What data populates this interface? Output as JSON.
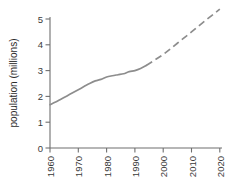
{
  "chart_data": {
    "type": "line",
    "title": "",
    "xlabel": "",
    "ylabel": "population (millions)",
    "xlim": [
      1960,
      2021
    ],
    "ylim": [
      0,
      5.3
    ],
    "grid": false,
    "legend": "none",
    "x_ticks": [
      "1960",
      "1970",
      "1980",
      "1990",
      "2000",
      "2010",
      "2020"
    ],
    "x_tick_values": [
      1960,
      1970,
      1980,
      1990,
      2000,
      2010,
      2020
    ],
    "y_ticks": [
      "0",
      "1",
      "2",
      "3",
      "4",
      "5"
    ],
    "y_tick_values": [
      0,
      1,
      2,
      3,
      4,
      5
    ],
    "series": [
      {
        "name": "population (observed)",
        "style": "solid",
        "color": "#8d8d8d",
        "x": [
          1960,
          1962,
          1964,
          1966,
          1968,
          1970,
          1972,
          1974,
          1976,
          1978,
          1980,
          1982,
          1984,
          1986,
          1988,
          1990,
          1992,
          1994
        ],
        "values": [
          1.68,
          1.78,
          1.9,
          2.02,
          2.14,
          2.26,
          2.38,
          2.5,
          2.6,
          2.66,
          2.75,
          2.8,
          2.84,
          2.88,
          2.96,
          3.0,
          3.08,
          3.2
        ]
      },
      {
        "name": "population (projected)",
        "style": "dashed",
        "color": "#8d8d8d",
        "x": [
          1994,
          2000,
          2005,
          2010,
          2015,
          2020
        ],
        "values": [
          3.2,
          3.62,
          4.06,
          4.5,
          4.95,
          5.38
        ]
      }
    ],
    "annotations": [
      "Solid line shows historical data 1960-1994",
      "Dashed line shows projection 1994-2020"
    ]
  },
  "axes": {
    "y_axis_title": "population (millions)"
  },
  "colors": {
    "line": "#8d8d8d",
    "axis": "#6f6f6f",
    "text": "#3a3a3a",
    "background": "#ffffff"
  }
}
